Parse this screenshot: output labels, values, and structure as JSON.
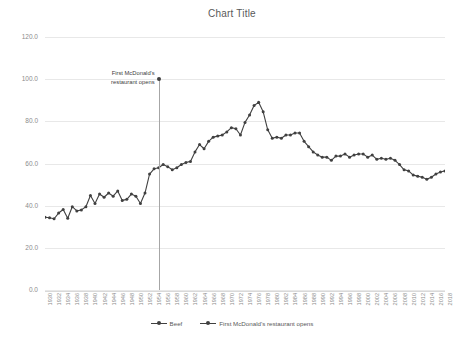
{
  "chart_data": {
    "type": "line",
    "title": "Chart Title",
    "xlabel": "",
    "ylabel": "",
    "ylim": [
      0,
      120
    ],
    "ytick_step": 20,
    "grid": true,
    "legend_position": "bottom",
    "xlim": [
      1930,
      2018
    ],
    "xtick_step": 2,
    "yticks": [
      "0.0",
      "20.0",
      "40.0",
      "60.0",
      "80.0",
      "100.0",
      "120.0"
    ],
    "xticks": [
      "1930",
      "1932",
      "1934",
      "1936",
      "1938",
      "1940",
      "1942",
      "1944",
      "1946",
      "1948",
      "1950",
      "1952",
      "1954",
      "1956",
      "1958",
      "1960",
      "1962",
      "1964",
      "1966",
      "1968",
      "1970",
      "1972",
      "1974",
      "1976",
      "1978",
      "1980",
      "1982",
      "1984",
      "1986",
      "1988",
      "1990",
      "1992",
      "1994",
      "1996",
      "1998",
      "2000",
      "2002",
      "2004",
      "2006",
      "2008",
      "2010",
      "2012",
      "2014",
      "2016",
      "2018"
    ],
    "series": [
      {
        "name": "Beef",
        "color": "#404040",
        "x": [
          1930,
          1931,
          1932,
          1933,
          1934,
          1935,
          1936,
          1937,
          1938,
          1939,
          1940,
          1941,
          1942,
          1943,
          1944,
          1945,
          1946,
          1947,
          1948,
          1949,
          1950,
          1951,
          1952,
          1953,
          1954,
          1955,
          1956,
          1957,
          1958,
          1959,
          1960,
          1961,
          1962,
          1963,
          1964,
          1965,
          1966,
          1967,
          1968,
          1969,
          1970,
          1971,
          1972,
          1973,
          1974,
          1975,
          1976,
          1977,
          1978,
          1979,
          1980,
          1981,
          1982,
          1983,
          1984,
          1985,
          1986,
          1987,
          1988,
          1989,
          1990,
          1991,
          1992,
          1993,
          1994,
          1995,
          1996,
          1997,
          1998,
          1999,
          2000,
          2001,
          2002,
          2003,
          2004,
          2005,
          2006,
          2007,
          2008,
          2009,
          2010,
          2011,
          2012,
          2013,
          2014,
          2015,
          2016,
          2017,
          2018
        ],
        "values": [
          34.5,
          34.3,
          33.8,
          36.5,
          38.2,
          34.0,
          39.5,
          37.5,
          38.0,
          39.5,
          44.8,
          41.0,
          45.5,
          44.0,
          46.0,
          44.5,
          47.0,
          42.5,
          43.0,
          45.5,
          44.5,
          41.0,
          46.0,
          55.0,
          57.5,
          58.0,
          59.5,
          58.5,
          57.0,
          58.0,
          59.5,
          60.5,
          61.0,
          65.5,
          69.0,
          67.0,
          70.5,
          72.5,
          73.0,
          73.5,
          75.0,
          77.0,
          76.5,
          73.5,
          79.5,
          83.0,
          87.5,
          89.0,
          84.5,
          76.0,
          72.0,
          72.5,
          72.0,
          73.5,
          73.5,
          74.5,
          74.5,
          70.5,
          68.0,
          65.5,
          64.0,
          63.0,
          63.0,
          61.5,
          63.5,
          63.5,
          64.5,
          63.0,
          64.0,
          64.5,
          64.5,
          63.0,
          64.0,
          62.0,
          62.5,
          62.0,
          62.5,
          61.5,
          59.5,
          57.0,
          56.5,
          54.5,
          54.0,
          53.5,
          52.5,
          53.5,
          55.0,
          56.0,
          56.5
        ]
      }
    ],
    "annotation": {
      "name": "First McDonald's restaurant opens",
      "text_line1": "First McDonald's",
      "text_line2": "restaurant opens",
      "year": 1955,
      "marker_value": 100.0,
      "color": "#404040"
    },
    "legend": [
      {
        "label": "Beef"
      },
      {
        "label": "First McDonald's restaurant opens"
      }
    ]
  }
}
